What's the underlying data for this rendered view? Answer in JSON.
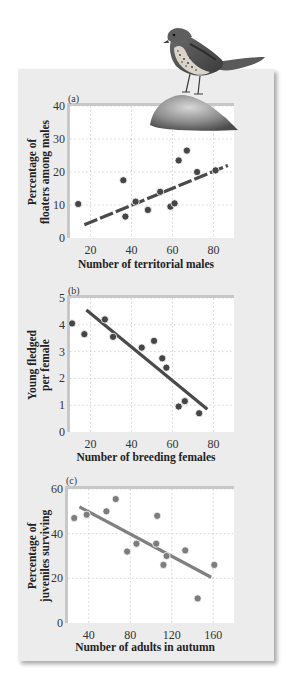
{
  "figure": {
    "panel_bg": "#ececec",
    "plot_bg": "#ffffff",
    "dot_dark": "#454545",
    "dot_light": "#7d7d7d",
    "line_dark": "#4a4a4a",
    "line_light": "#808080",
    "illustration": "song-sparrow-on-rock"
  },
  "chart_data": [
    {
      "type": "scatter",
      "panel_label": "(a)",
      "title": "",
      "xlabel": "Number of territorial males",
      "ylabel": "Percentage of floaters among males",
      "ylabel_lines": [
        "Percentage of",
        "floaters among males"
      ],
      "xlim": [
        10,
        90
      ],
      "ylim": [
        0,
        40
      ],
      "xticks": [
        20,
        40,
        60,
        80
      ],
      "yticks": [
        0,
        10,
        20,
        30,
        40
      ],
      "grid": true,
      "points": [
        {
          "x": 14,
          "y": 10.3
        },
        {
          "x": 36,
          "y": 17.5
        },
        {
          "x": 37,
          "y": 6.5
        },
        {
          "x": 42,
          "y": 11
        },
        {
          "x": 48,
          "y": 8.5
        },
        {
          "x": 54,
          "y": 14
        },
        {
          "x": 59,
          "y": 9.5
        },
        {
          "x": 61,
          "y": 10.5
        },
        {
          "x": 63,
          "y": 23.5
        },
        {
          "x": 67,
          "y": 26.5
        },
        {
          "x": 72,
          "y": 20
        },
        {
          "x": 81,
          "y": 20.5
        }
      ],
      "trend_line": {
        "x1": 17,
        "y1": 4,
        "x2": 87,
        "y2": 22
      }
    },
    {
      "type": "scatter",
      "panel_label": "(b)",
      "title": "",
      "xlabel": "Number of breeding females",
      "ylabel": "Young fledged per female",
      "ylabel_lines": [
        "Young fledged",
        "per female"
      ],
      "xlim": [
        10,
        90
      ],
      "ylim": [
        0,
        5
      ],
      "xticks": [
        20,
        40,
        60,
        80
      ],
      "yticks": [
        0,
        1,
        2,
        3,
        4,
        5
      ],
      "grid": true,
      "points": [
        {
          "x": 11,
          "y": 4.05
        },
        {
          "x": 17,
          "y": 3.65
        },
        {
          "x": 27,
          "y": 4.2
        },
        {
          "x": 31,
          "y": 3.55
        },
        {
          "x": 45,
          "y": 3.15
        },
        {
          "x": 51,
          "y": 3.4
        },
        {
          "x": 55,
          "y": 2.75
        },
        {
          "x": 57,
          "y": 2.4
        },
        {
          "x": 63,
          "y": 0.95
        },
        {
          "x": 66,
          "y": 1.15
        },
        {
          "x": 73,
          "y": 0.7
        }
      ],
      "trend_line": {
        "x1": 18,
        "y1": 4.55,
        "x2": 77,
        "y2": 0.85
      }
    },
    {
      "type": "scatter",
      "panel_label": "(c)",
      "title": "",
      "xlabel": "Number of adults in autumn",
      "ylabel": "Percentage of juveniles surviving",
      "ylabel_lines": [
        "Percentage of",
        "juveniles surviving"
      ],
      "xlim": [
        20,
        180
      ],
      "ylim": [
        0,
        60
      ],
      "xticks": [
        40,
        80,
        120,
        160
      ],
      "yticks": [
        0,
        20,
        40,
        60
      ],
      "grid": true,
      "points": [
        {
          "x": 26,
          "y": 47
        },
        {
          "x": 38,
          "y": 48.5
        },
        {
          "x": 57,
          "y": 50
        },
        {
          "x": 66,
          "y": 55.5
        },
        {
          "x": 77,
          "y": 32
        },
        {
          "x": 86,
          "y": 35.5
        },
        {
          "x": 105,
          "y": 35.5
        },
        {
          "x": 106,
          "y": 48
        },
        {
          "x": 112,
          "y": 26
        },
        {
          "x": 115,
          "y": 30
        },
        {
          "x": 133,
          "y": 32.5
        },
        {
          "x": 145,
          "y": 11
        },
        {
          "x": 161,
          "y": 26
        }
      ],
      "trend_line": {
        "x1": 31,
        "y1": 52,
        "x2": 158,
        "y2": 20.5
      }
    }
  ]
}
